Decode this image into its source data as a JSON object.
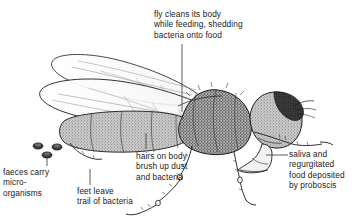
{
  "diagram": {
    "background_color": "#ffffff",
    "ink_color": "#1a1a1a",
    "body_fill": "#b9b9b9",
    "eye_fill": "#2e2e2e",
    "labels": {
      "top": "fly cleans its body\nwhile feeding, shedding\nbacteria onto food",
      "hairs": "hairs on body\nbrush up dust\nand bacteria",
      "feet": "feet leave\ntrail of bacteria",
      "faeces": "faeces carry\nmicro-\norganisms",
      "saliva": "saliva and\nregurgitated\nfood deposited\nby proboscis"
    },
    "parts": {
      "wing_upper": "upper-wing",
      "wing_lower": "lower-wing",
      "abdomen": "abdomen",
      "thorax": "thorax",
      "head": "head",
      "eye": "compound-eye",
      "proboscis": "proboscis",
      "antenna": "antenna",
      "legs": "legs",
      "faeces_dots": "faeces-dots"
    }
  }
}
